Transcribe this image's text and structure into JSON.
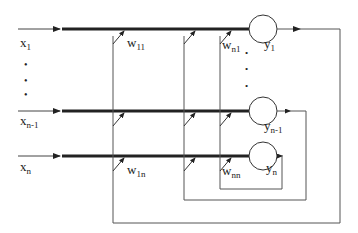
{
  "diagram": {
    "title": "",
    "type": "recurrent-neural-network",
    "colors": {
      "line": "#333333",
      "bus": "#222222",
      "background": "#ffffff"
    },
    "inputs": [
      {
        "id": "x1",
        "base": "x",
        "sub": "1"
      },
      {
        "id": "xn-1",
        "base": "x",
        "sub": "n-1"
      },
      {
        "id": "xn",
        "base": "x",
        "sub": "n"
      }
    ],
    "outputs": [
      {
        "id": "y1",
        "base": "y",
        "sub": "1"
      },
      {
        "id": "yn-1",
        "base": "y",
        "sub": "n-1"
      },
      {
        "id": "yn",
        "base": "y",
        "sub": "n"
      }
    ],
    "weights": [
      {
        "id": "w11",
        "base": "w",
        "sub": "11"
      },
      {
        "id": "wn1",
        "base": "w",
        "sub": "n1"
      },
      {
        "id": "w1n",
        "base": "w",
        "sub": "1n"
      },
      {
        "id": "wnn",
        "base": "w",
        "sub": "nn"
      }
    ],
    "ellipsis": "•"
  }
}
